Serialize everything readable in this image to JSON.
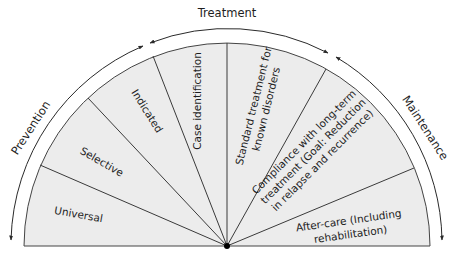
{
  "diagram": {
    "center": {
      "x": 227,
      "y": 246
    },
    "fan_radius": 203,
    "arc_radius": 217,
    "fan_fill": "#ededed",
    "line_color": "#3a3a3a",
    "phases": [
      {
        "id": "prevention",
        "label": "Prevention"
      },
      {
        "id": "treatment",
        "label": "Treatment"
      },
      {
        "id": "maintenance",
        "label": "Maintenance"
      }
    ],
    "sectors": [
      {
        "id": "universal",
        "phase": "prevention",
        "lines": [
          "Universal"
        ]
      },
      {
        "id": "selective",
        "phase": "prevention",
        "lines": [
          "Selective"
        ]
      },
      {
        "id": "indicated",
        "phase": "prevention",
        "lines": [
          "Indicated"
        ]
      },
      {
        "id": "case-identification",
        "phase": "treatment",
        "lines": [
          "Case identification"
        ]
      },
      {
        "id": "standard-treatment",
        "phase": "treatment",
        "lines": [
          "Standard treatment for",
          "known disorders"
        ]
      },
      {
        "id": "compliance",
        "phase": "maintenance",
        "lines": [
          "Compliance with long-term",
          "treatment (Goal: Reduction",
          "in relapse and recurrence)"
        ]
      },
      {
        "id": "after-care",
        "phase": "maintenance",
        "lines": [
          "After-care (Including",
          "rehabilitation)"
        ]
      }
    ]
  }
}
